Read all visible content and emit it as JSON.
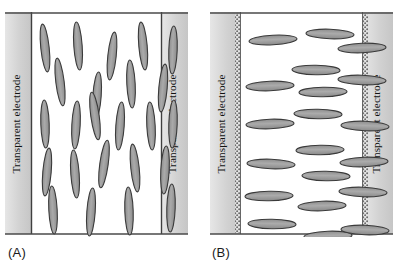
{
  "figure": {
    "background_color": "#ffffff"
  },
  "colors": {
    "electrode_band": "#d4d4d4",
    "electrode_band_edge": "#9a9a9a",
    "molecule_fill": "#9e9e9e",
    "molecule_stroke": "#3a3a3a",
    "frame_line": "#555555",
    "dot_texture": "#6e6e6e",
    "text": "#111111"
  },
  "panels": [
    {
      "id": "A",
      "caption": "(A)",
      "state_name": "vertical-alignment",
      "electrode_border_style": "solid",
      "left_electrode": {
        "label": "Transparent electrode"
      },
      "right_electrode": {
        "label": "Transparent electrode"
      },
      "molecules": {
        "orientation": "near-vertical",
        "rx": 4.2,
        "ry": 24,
        "items": [
          {
            "cx": 40,
            "cy": 36,
            "angle": -6
          },
          {
            "cx": 73,
            "cy": 34,
            "angle": -4
          },
          {
            "cx": 107,
            "cy": 44,
            "angle": 6
          },
          {
            "cx": 138,
            "cy": 34,
            "angle": -5
          },
          {
            "cx": 168,
            "cy": 38,
            "angle": 2
          },
          {
            "cx": 55,
            "cy": 70,
            "angle": -7
          },
          {
            "cx": 92,
            "cy": 84,
            "angle": 4
          },
          {
            "cx": 126,
            "cy": 72,
            "angle": -3
          },
          {
            "cx": 158,
            "cy": 76,
            "angle": 5
          },
          {
            "cx": 40,
            "cy": 112,
            "angle": -2
          },
          {
            "cx": 71,
            "cy": 113,
            "angle": 3
          },
          {
            "cx": 90,
            "cy": 104,
            "angle": -8
          },
          {
            "cx": 115,
            "cy": 114,
            "angle": 4
          },
          {
            "cx": 146,
            "cy": 114,
            "angle": -3
          },
          {
            "cx": 168,
            "cy": 112,
            "angle": 2
          },
          {
            "cx": 42,
            "cy": 160,
            "angle": 5
          },
          {
            "cx": 70,
            "cy": 162,
            "angle": -4
          },
          {
            "cx": 99,
            "cy": 152,
            "angle": 8
          },
          {
            "cx": 130,
            "cy": 156,
            "angle": -6
          },
          {
            "cx": 160,
            "cy": 158,
            "angle": 3
          },
          {
            "cx": 48,
            "cy": 198,
            "angle": -3
          },
          {
            "cx": 86,
            "cy": 200,
            "angle": 4
          },
          {
            "cx": 124,
            "cy": 199,
            "angle": -2
          },
          {
            "cx": 166,
            "cy": 196,
            "angle": 2
          }
        ]
      }
    },
    {
      "id": "B",
      "caption": "(B)",
      "state_name": "horizontal-alignment",
      "electrode_border_style": "dotted",
      "left_electrode": {
        "label": "Transparent electrode"
      },
      "right_electrode": {
        "label": "Transparent electrode"
      },
      "molecules": {
        "orientation": "near-horizontal",
        "rx": 24,
        "ry": 4.8,
        "items": [
          {
            "cx": 63,
            "cy": 28,
            "angle": -3
          },
          {
            "cx": 120,
            "cy": 22,
            "angle": 2
          },
          {
            "cx": 152,
            "cy": 36,
            "angle": -2
          },
          {
            "cx": 106,
            "cy": 58,
            "angle": 1
          },
          {
            "cx": 60,
            "cy": 74,
            "angle": -2
          },
          {
            "cx": 152,
            "cy": 68,
            "angle": 2
          },
          {
            "cx": 113,
            "cy": 80,
            "angle": -1
          },
          {
            "cx": 108,
            "cy": 102,
            "angle": 1
          },
          {
            "cx": 60,
            "cy": 112,
            "angle": -2
          },
          {
            "cx": 155,
            "cy": 114,
            "angle": 2
          },
          {
            "cx": 110,
            "cy": 138,
            "angle": -1
          },
          {
            "cx": 61,
            "cy": 152,
            "angle": 2
          },
          {
            "cx": 154,
            "cy": 150,
            "angle": -2
          },
          {
            "cx": 116,
            "cy": 164,
            "angle": 1
          },
          {
            "cx": 59,
            "cy": 184,
            "angle": -1
          },
          {
            "cx": 153,
            "cy": 180,
            "angle": 2
          },
          {
            "cx": 112,
            "cy": 194,
            "angle": -2
          },
          {
            "cx": 62,
            "cy": 212,
            "angle": 1
          },
          {
            "cx": 118,
            "cy": 224,
            "angle": -2
          },
          {
            "cx": 155,
            "cy": 218,
            "angle": 2
          }
        ]
      }
    }
  ]
}
